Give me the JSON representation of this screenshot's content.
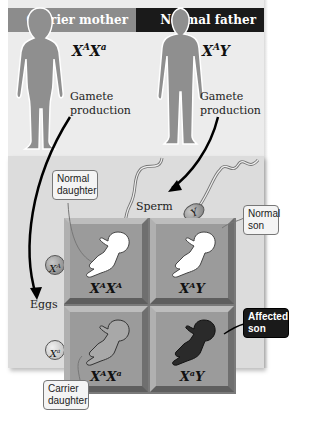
{
  "parents": {
    "mother": {
      "label": "Carrier mother",
      "genotype_base": "X",
      "genotype": [
        {
          "allele": "A"
        },
        {
          "allele": "a"
        }
      ],
      "gamete_label": "Gamete production",
      "header_color": "#8c8c8c"
    },
    "father": {
      "label": "Normal father",
      "genotype_x": "X",
      "genotype_allele": "A",
      "genotype_y": "Y",
      "gamete_label": "Gamete production",
      "header_color": "#1a1a1a"
    }
  },
  "mother_genotype": {
    "x1": "X",
    "a1": "A",
    "x2": "X",
    "a2": "a"
  },
  "father_genotype": {
    "x1": "X",
    "a1": "A",
    "y": "Y"
  },
  "gametes": {
    "sperm_label": "Sperm",
    "eggs_label": "Eggs",
    "sperm": [
      {
        "base": "X",
        "allele": "A"
      },
      {
        "base": "Y",
        "allele": ""
      }
    ],
    "eggs": [
      {
        "base": "X",
        "allele": "A"
      },
      {
        "base": "X",
        "allele": "a"
      }
    ]
  },
  "punnett": {
    "cells": [
      {
        "x1": "X",
        "a1": "A",
        "x2": "X",
        "a2": "A",
        "phenotype": "Normal daughter",
        "fill": "#ffffff"
      },
      {
        "x1": "X",
        "a1": "A",
        "x2": "Y",
        "a2": "",
        "phenotype": "Normal son",
        "fill": "#ffffff"
      },
      {
        "x1": "X",
        "a1": "A",
        "x2": "X",
        "a2": "a",
        "phenotype": "Carrier daughter",
        "fill": "#a8a8a8"
      },
      {
        "x1": "X",
        "a1": "a",
        "x2": "Y",
        "a2": "",
        "phenotype": "Affected son",
        "fill": "#2a2a2a"
      }
    ]
  },
  "callouts": {
    "normal_daughter": [
      "Normal",
      "daughter"
    ],
    "normal_son": [
      "Normal",
      "son"
    ],
    "carrier_daughter": [
      "Carrier",
      "daughter"
    ],
    "affected_son": [
      "Affected",
      "son"
    ]
  },
  "colors": {
    "panel_top": "#ececec",
    "panel_bottom": "#dcdcdc",
    "cell": "#9b9b9b",
    "figure": "#8f8f8f"
  }
}
